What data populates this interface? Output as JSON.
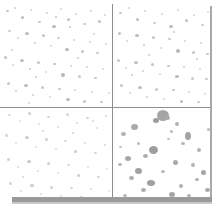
{
  "figure": {
    "type": "particle-density-panel",
    "title": "",
    "background_color": "#ffffff",
    "divider_color": "#8e8e8e",
    "frame_color": "#a9a9a9",
    "bottom_bar_color": "#9a9a9a",
    "width_px": 224,
    "height_px": 220
  },
  "chart_data": {
    "type": "scatter",
    "title": "",
    "subtitle": "",
    "xlabel": "",
    "ylabel": "",
    "grid": true,
    "legend": null,
    "layout": "2x2 panel grid",
    "panels": [
      {
        "id": "top-left",
        "label": "",
        "particle_count": 96,
        "mean_particle_size_px": 2.4,
        "density": "high",
        "color": "#c6c6c6"
      },
      {
        "id": "top-right",
        "label": "",
        "particle_count": 82,
        "mean_particle_size_px": 2.2,
        "density": "high",
        "color": "#c9c9c9"
      },
      {
        "id": "bottom-left",
        "label": "",
        "particle_count": 54,
        "mean_particle_size_px": 2.0,
        "density": "low",
        "color": "#d8d8d8"
      },
      {
        "id": "bottom-right",
        "label": "",
        "particle_count": 34,
        "mean_particle_size_px": 5.6,
        "density": "sparse-large",
        "color": "#a8a8a8"
      }
    ],
    "particles": {
      "top_left": [
        [
          6,
          6,
          3,
          2,
          "#c0c0c0"
        ],
        [
          14,
          3,
          2,
          2,
          "#cfcfcf"
        ],
        [
          21,
          12,
          3,
          3,
          "#bdbdbd"
        ],
        [
          30,
          5,
          2,
          2,
          "#d2d2d2"
        ],
        [
          38,
          17,
          3,
          2,
          "#c4c4c4"
        ],
        [
          46,
          8,
          2,
          2,
          "#cccccc"
        ],
        [
          52,
          21,
          4,
          3,
          "#b9b9b9"
        ],
        [
          60,
          4,
          2,
          2,
          "#d4d4d4"
        ],
        [
          67,
          14,
          3,
          3,
          "#c2c2c2"
        ],
        [
          75,
          9,
          2,
          2,
          "#cfcfcf"
        ],
        [
          83,
          19,
          3,
          2,
          "#c6c6c6"
        ],
        [
          90,
          6,
          2,
          2,
          "#d0d0d0"
        ],
        [
          98,
          16,
          3,
          3,
          "#bfbfbf"
        ],
        [
          104,
          10,
          2,
          2,
          "#d3d3d3"
        ],
        [
          8,
          26,
          3,
          2,
          "#c7c7c7"
        ],
        [
          17,
          33,
          2,
          2,
          "#d1d1d1"
        ],
        [
          25,
          28,
          4,
          3,
          "#bcbcbc"
        ],
        [
          34,
          38,
          2,
          2,
          "#cecece"
        ],
        [
          42,
          30,
          3,
          3,
          "#c3c3c3"
        ],
        [
          50,
          41,
          2,
          2,
          "#d5d5d5"
        ],
        [
          57,
          33,
          3,
          2,
          "#c8c8c8"
        ],
        [
          65,
          44,
          4,
          3,
          "#bababa"
        ],
        [
          73,
          35,
          2,
          2,
          "#d0d0d0"
        ],
        [
          81,
          46,
          3,
          3,
          "#c5c5c5"
        ],
        [
          89,
          37,
          2,
          2,
          "#d2d2d2"
        ],
        [
          96,
          48,
          3,
          2,
          "#c1c1c1"
        ],
        [
          105,
          39,
          2,
          2,
          "#d6d6d6"
        ],
        [
          4,
          52,
          3,
          3,
          "#c4c4c4"
        ],
        [
          12,
          60,
          2,
          2,
          "#d1d1d1"
        ],
        [
          20,
          55,
          4,
          3,
          "#bebebe"
        ],
        [
          29,
          64,
          2,
          2,
          "#cdcdcd"
        ],
        [
          37,
          57,
          3,
          3,
          "#c6c6c6"
        ],
        [
          45,
          67,
          2,
          2,
          "#d4d4d4"
        ],
        [
          53,
          59,
          3,
          2,
          "#c0c0c0"
        ],
        [
          61,
          69,
          4,
          4,
          "#b7b7b7"
        ],
        [
          70,
          61,
          2,
          2,
          "#cfcfcf"
        ],
        [
          78,
          71,
          3,
          3,
          "#c7c7c7"
        ],
        [
          86,
          62,
          2,
          2,
          "#d3d3d3"
        ],
        [
          94,
          73,
          3,
          2,
          "#c2c2c2"
        ],
        [
          102,
          64,
          2,
          2,
          "#d7d7d7"
        ],
        [
          7,
          78,
          3,
          3,
          "#c5c5c5"
        ],
        [
          15,
          86,
          2,
          2,
          "#d0d0d0"
        ],
        [
          24,
          80,
          4,
          3,
          "#bdbdbd"
        ],
        [
          32,
          90,
          2,
          2,
          "#cecece"
        ],
        [
          41,
          82,
          3,
          3,
          "#c8c8c8"
        ],
        [
          49,
          92,
          2,
          2,
          "#d5d5d5"
        ],
        [
          58,
          84,
          3,
          2,
          "#c1c1c1"
        ],
        [
          66,
          94,
          4,
          3,
          "#bbbbbb"
        ],
        [
          74,
          85,
          2,
          2,
          "#d1d1d1"
        ],
        [
          83,
          96,
          3,
          3,
          "#c6c6c6"
        ],
        [
          91,
          87,
          2,
          2,
          "#d4d4d4"
        ],
        [
          100,
          97,
          3,
          2,
          "#c3c3c3"
        ],
        [
          108,
          88,
          2,
          2,
          "#d8d8d8"
        ],
        [
          11,
          45,
          2,
          2,
          "#cacaca"
        ],
        [
          35,
          72,
          2,
          2,
          "#cbcbcb"
        ],
        [
          69,
          22,
          2,
          2,
          "#c9c9c9"
        ],
        [
          93,
          29,
          2,
          2,
          "#cdcdcd"
        ],
        [
          28,
          98,
          2,
          2,
          "#d2d2d2"
        ],
        [
          55,
          12,
          2,
          2,
          "#c5c5c5"
        ],
        [
          77,
          53,
          2,
          2,
          "#c7c7c7"
        ]
      ],
      "top_right": [
        [
          6,
          8,
          3,
          2,
          "#c4c4c4"
        ],
        [
          15,
          3,
          2,
          2,
          "#d2d2d2"
        ],
        [
          23,
          14,
          3,
          3,
          "#bfbfbf"
        ],
        [
          31,
          6,
          2,
          2,
          "#d0d0d0"
        ],
        [
          40,
          18,
          3,
          2,
          "#c7c7c7"
        ],
        [
          48,
          9,
          2,
          2,
          "#cfcfcf"
        ],
        [
          56,
          21,
          4,
          3,
          "#bcbcbc"
        ],
        [
          64,
          5,
          2,
          2,
          "#d5d5d5"
        ],
        [
          72,
          15,
          3,
          3,
          "#c3c3c3"
        ],
        [
          80,
          10,
          2,
          2,
          "#d1d1d1"
        ],
        [
          88,
          20,
          3,
          2,
          "#c8c8c8"
        ],
        [
          94,
          7,
          2,
          2,
          "#d4d4d4"
        ],
        [
          5,
          28,
          3,
          3,
          "#c1c1c1"
        ],
        [
          13,
          36,
          2,
          2,
          "#d3d3d3"
        ],
        [
          22,
          30,
          4,
          3,
          "#bbbbbb"
        ],
        [
          30,
          40,
          2,
          2,
          "#cecece"
        ],
        [
          39,
          32,
          3,
          3,
          "#c5c5c5"
        ],
        [
          47,
          43,
          2,
          2,
          "#d6d6d6"
        ],
        [
          55,
          34,
          3,
          2,
          "#c0c0c0"
        ],
        [
          63,
          45,
          4,
          4,
          "#b8b8b8"
        ],
        [
          71,
          36,
          2,
          2,
          "#d0d0d0"
        ],
        [
          79,
          47,
          3,
          3,
          "#c6c6c6"
        ],
        [
          87,
          38,
          2,
          2,
          "#d2d2d2"
        ],
        [
          93,
          49,
          3,
          2,
          "#c2c2c2"
        ],
        [
          4,
          55,
          3,
          3,
          "#c9c9c9"
        ],
        [
          12,
          63,
          2,
          2,
          "#d4d4d4"
        ],
        [
          21,
          57,
          4,
          3,
          "#bebebe"
        ],
        [
          29,
          66,
          2,
          2,
          "#cdcdcd"
        ],
        [
          38,
          59,
          3,
          3,
          "#c4c4c4"
        ],
        [
          46,
          69,
          2,
          2,
          "#d5d5d5"
        ],
        [
          54,
          61,
          3,
          2,
          "#c1c1c1"
        ],
        [
          62,
          71,
          4,
          3,
          "#b9b9b9"
        ],
        [
          70,
          62,
          2,
          2,
          "#d1d1d1"
        ],
        [
          78,
          73,
          3,
          3,
          "#c7c7c7"
        ],
        [
          86,
          64,
          2,
          2,
          "#d3d3d3"
        ],
        [
          92,
          74,
          3,
          2,
          "#c3c3c3"
        ],
        [
          7,
          80,
          3,
          3,
          "#c6c6c6"
        ],
        [
          16,
          88,
          2,
          2,
          "#d0d0d0"
        ],
        [
          25,
          82,
          4,
          3,
          "#bdbdbd"
        ],
        [
          33,
          92,
          2,
          2,
          "#cfcfcf"
        ],
        [
          42,
          84,
          3,
          3,
          "#c8c8c8"
        ],
        [
          50,
          94,
          2,
          2,
          "#d6d6d6"
        ],
        [
          59,
          85,
          3,
          2,
          "#c2c2c2"
        ],
        [
          67,
          96,
          3,
          3,
          "#bcbcbc"
        ],
        [
          75,
          87,
          2,
          2,
          "#d2d2d2"
        ],
        [
          84,
          97,
          3,
          2,
          "#c5c5c5"
        ],
        [
          91,
          89,
          2,
          2,
          "#d7d7d7"
        ],
        [
          35,
          50,
          2,
          2,
          "#cacaca"
        ],
        [
          60,
          27,
          2,
          2,
          "#c8c8c8"
        ],
        [
          18,
          70,
          2,
          2,
          "#cccccc"
        ],
        [
          83,
          54,
          2,
          2,
          "#c6c6c6"
        ]
      ],
      "bottom_left": [
        [
          8,
          6,
          3,
          2,
          "#d5d5d5"
        ],
        [
          19,
          12,
          2,
          2,
          "#dcdcdc"
        ],
        [
          28,
          4,
          3,
          3,
          "#d0d0d0"
        ],
        [
          38,
          15,
          2,
          2,
          "#d8d8d8"
        ],
        [
          47,
          8,
          3,
          2,
          "#d2d2d2"
        ],
        [
          57,
          18,
          2,
          2,
          "#dadada"
        ],
        [
          66,
          5,
          3,
          3,
          "#cececece"
        ],
        [
          76,
          14,
          2,
          2,
          "#d7d7d7"
        ],
        [
          86,
          9,
          3,
          2,
          "#d1d1d1"
        ],
        [
          96,
          19,
          2,
          2,
          "#dbdbdb"
        ],
        [
          105,
          7,
          2,
          2,
          "#d6d6d6"
        ],
        [
          5,
          26,
          3,
          3,
          "#d3d3d3"
        ],
        [
          15,
          34,
          2,
          2,
          "#dddddd"
        ],
        [
          25,
          28,
          4,
          3,
          "#cbcbcb"
        ],
        [
          35,
          38,
          2,
          2,
          "#d9d9d9"
        ],
        [
          45,
          30,
          3,
          3,
          "#d0d0d0"
        ],
        [
          55,
          40,
          2,
          2,
          "#dcdcdc"
        ],
        [
          64,
          32,
          3,
          2,
          "#d4d4d4"
        ],
        [
          74,
          42,
          3,
          3,
          "#cdcdcd"
        ],
        [
          84,
          34,
          2,
          2,
          "#d8d8d8"
        ],
        [
          94,
          44,
          3,
          2,
          "#d2d2d2"
        ],
        [
          104,
          36,
          2,
          2,
          "#dadada"
        ],
        [
          7,
          50,
          3,
          3,
          "#d1d1d1"
        ],
        [
          17,
          58,
          2,
          2,
          "#dbdbdb"
        ],
        [
          27,
          52,
          4,
          3,
          "#c9c9c9"
        ],
        [
          37,
          62,
          2,
          2,
          "#d7d7d7"
        ],
        [
          47,
          54,
          3,
          3,
          "#cfcfcf"
        ],
        [
          57,
          64,
          2,
          2,
          "#dcdcdc"
        ],
        [
          67,
          56,
          3,
          2,
          "#d3d3d3"
        ],
        [
          77,
          66,
          3,
          3,
          "#cccccc"
        ],
        [
          87,
          58,
          2,
          2,
          "#d9d9d9"
        ],
        [
          97,
          68,
          3,
          2,
          "#d1d1d1"
        ],
        [
          106,
          60,
          2,
          2,
          "#dedede"
        ],
        [
          9,
          74,
          3,
          3,
          "#d2d2d2"
        ],
        [
          20,
          82,
          2,
          2,
          "#dadada"
        ],
        [
          30,
          76,
          4,
          3,
          "#cacaca"
        ],
        [
          40,
          85,
          2,
          2,
          "#d8d8d8"
        ],
        [
          50,
          78,
          3,
          3,
          "#d0d0d0"
        ],
        [
          60,
          87,
          2,
          2,
          "#dddddd"
        ],
        [
          70,
          79,
          3,
          2,
          "#d4d4d4"
        ],
        [
          80,
          88,
          3,
          3,
          "#cbcbcb"
        ],
        [
          90,
          80,
          2,
          2,
          "#d9d9d9"
        ],
        [
          100,
          89,
          3,
          2,
          "#d2d2d2"
        ],
        [
          108,
          82,
          2,
          2,
          "#dfdfdf"
        ],
        [
          42,
          22,
          2,
          2,
          "#d6d6d6"
        ],
        [
          72,
          24,
          2,
          2,
          "#d5d5d5"
        ],
        [
          22,
          68,
          2,
          2,
          "#d7d7d7"
        ],
        [
          92,
          12,
          2,
          2,
          "#d4d4d4"
        ]
      ],
      "bottom_right": [
        [
          44,
          2,
          12,
          11,
          "#a5a5a5"
        ],
        [
          40,
          10,
          6,
          5,
          "#9e9e9e"
        ],
        [
          52,
          8,
          5,
          4,
          "#ababab"
        ],
        [
          62,
          14,
          4,
          4,
          "#b2b2b2"
        ],
        [
          57,
          22,
          3,
          3,
          "#b8b8b8"
        ],
        [
          18,
          16,
          7,
          6,
          "#a9a9a9"
        ],
        [
          8,
          24,
          5,
          4,
          "#b0b0b0"
        ],
        [
          72,
          24,
          6,
          8,
          "#a3a3a3"
        ],
        [
          68,
          34,
          4,
          3,
          "#b4b4b4"
        ],
        [
          36,
          38,
          9,
          8,
          "#9d9d9d"
        ],
        [
          30,
          46,
          5,
          4,
          "#aeaeae"
        ],
        [
          84,
          40,
          4,
          4,
          "#b1b1b1"
        ],
        [
          12,
          48,
          6,
          5,
          "#a7a7a7"
        ],
        [
          5,
          55,
          4,
          3,
          "#b5b5b5"
        ],
        [
          60,
          52,
          5,
          5,
          "#a9a9a9"
        ],
        [
          78,
          55,
          4,
          4,
          "#b3b3b3"
        ],
        [
          22,
          60,
          7,
          6,
          "#a1a1a1"
        ],
        [
          16,
          68,
          5,
          4,
          "#adadad"
        ],
        [
          48,
          62,
          4,
          3,
          "#b6b6b6"
        ],
        [
          88,
          62,
          5,
          5,
          "#a6a6a6"
        ],
        [
          82,
          70,
          4,
          3,
          "#b2b2b2"
        ],
        [
          34,
          72,
          8,
          6,
          "#9f9f9f"
        ],
        [
          28,
          80,
          5,
          4,
          "#acacac"
        ],
        [
          66,
          76,
          4,
          4,
          "#b0b0b0"
        ],
        [
          56,
          84,
          6,
          5,
          "#a4a4a4"
        ],
        [
          74,
          86,
          4,
          3,
          "#b4b4b4"
        ],
        [
          92,
          80,
          5,
          4,
          "#a8a8a8"
        ],
        [
          10,
          86,
          4,
          3,
          "#b7b7b7"
        ],
        [
          46,
          90,
          3,
          3,
          "#bababa"
        ],
        [
          86,
          90,
          4,
          3,
          "#b1b1b1"
        ],
        [
          24,
          34,
          3,
          3,
          "#bcbcbc"
        ],
        [
          54,
          30,
          3,
          2,
          "#bebebe"
        ],
        [
          94,
          20,
          3,
          3,
          "#b9b9b9"
        ],
        [
          6,
          38,
          3,
          2,
          "#bdbdbd"
        ]
      ]
    }
  }
}
